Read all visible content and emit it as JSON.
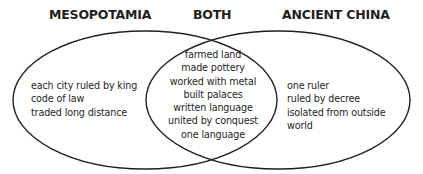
{
  "diagram": {
    "type": "venn",
    "headings": {
      "left": "MESOPOTAMIA",
      "middle": "BOTH",
      "right": "ANCIENT CHINA"
    },
    "sets": {
      "left": {
        "name": "MESOPOTAMIA",
        "items": [
          "each city ruled by king",
          "code of law",
          "traded long distance"
        ]
      },
      "both": {
        "name": "BOTH",
        "items": [
          "farmed land",
          "made pottery",
          "worked with metal",
          "built palaces",
          "written language",
          "united by conquest",
          "one language"
        ]
      },
      "right": {
        "name": "ANCIENT CHINA",
        "items": [
          "one ruler",
          "ruled by decree",
          "isolated from outside",
          "world"
        ]
      }
    },
    "colors": {
      "stroke": "#231f20",
      "text": "#231f20",
      "background": "#ffffff"
    }
  }
}
